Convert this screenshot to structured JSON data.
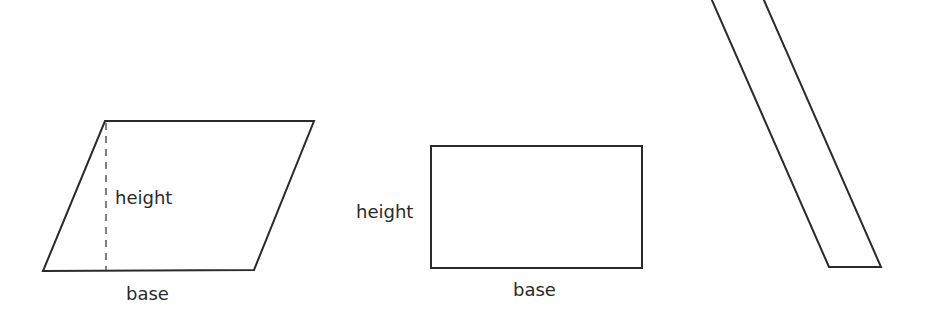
{
  "figures": {
    "parallelogram": {
      "height_label": "height",
      "base_label": "base"
    },
    "rectangle": {
      "height_label": "height",
      "base_label": "base"
    },
    "slanted_strip": {}
  },
  "colors": {
    "stroke": "#2a2a2a",
    "background": "#ffffff"
  }
}
